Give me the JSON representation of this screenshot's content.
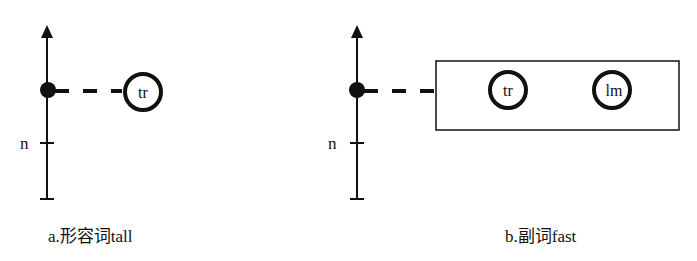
{
  "panels": [
    {
      "id": "a",
      "caption": "a.形容词tall",
      "axis_tick_label": "n",
      "circles": [
        "tr"
      ],
      "has_box": false
    },
    {
      "id": "b",
      "caption": "b.副词fast",
      "axis_tick_label": "n",
      "circles": [
        "tr",
        "lm"
      ],
      "has_box": true
    }
  ],
  "colors": {
    "ink": "#111111",
    "background": "#ffffff"
  }
}
